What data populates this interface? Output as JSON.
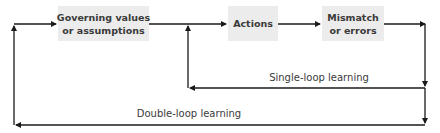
{
  "diagram": {
    "type": "flow-loop",
    "nodes": [
      {
        "id": "governing",
        "lines": [
          "Governing values",
          "or assumptions"
        ]
      },
      {
        "id": "actions",
        "lines": [
          "Actions"
        ]
      },
      {
        "id": "mismatch",
        "lines": [
          "Mismatch",
          "or errors"
        ]
      }
    ],
    "edges": [
      {
        "from": "governing",
        "to": "actions"
      },
      {
        "from": "actions",
        "to": "mismatch"
      },
      {
        "from": "mismatch",
        "to": "actions",
        "label": "Single-loop learning"
      },
      {
        "from": "mismatch",
        "to": "governing",
        "label": "Double-loop learning"
      }
    ],
    "colors": {
      "box_fill": "#ececec",
      "line": "#1a1a1a",
      "text": "#3a3a3a"
    }
  },
  "labels": {
    "node0_line1": "Governing values",
    "node0_line2": "or assumptions",
    "node1_line1": "Actions",
    "node2_line1": "Mismatch",
    "node2_line2": "or errors",
    "single_loop": "Single-loop learning",
    "double_loop": "Double-loop learning"
  }
}
